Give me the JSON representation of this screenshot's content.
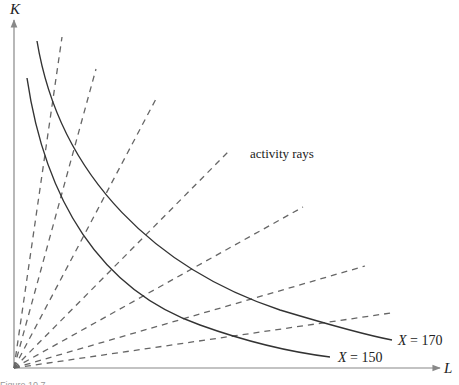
{
  "figure": {
    "axes": {
      "x_label": "L",
      "y_label": "K",
      "origin": [
        14,
        368
      ],
      "x_end": [
        442,
        368
      ],
      "y_end": [
        14,
        18
      ]
    },
    "isoquants": [
      {
        "label_var": "X",
        "label_value": "= 150",
        "label": "X = 150"
      },
      {
        "label_var": "X",
        "label_value": "= 170",
        "label": "X = 170"
      }
    ],
    "annotation": "activity rays",
    "ray_endpoints": [
      [
        62,
        37
      ],
      [
        96,
        69
      ],
      [
        157,
        97
      ],
      [
        228,
        152
      ],
      [
        303,
        207
      ],
      [
        365,
        266
      ],
      [
        391,
        313
      ]
    ],
    "colors": {
      "axis": "#888888",
      "curve": "#333333",
      "ray": "#666666",
      "text": "#222222"
    },
    "caption": "Figure 10.7 ..."
  }
}
